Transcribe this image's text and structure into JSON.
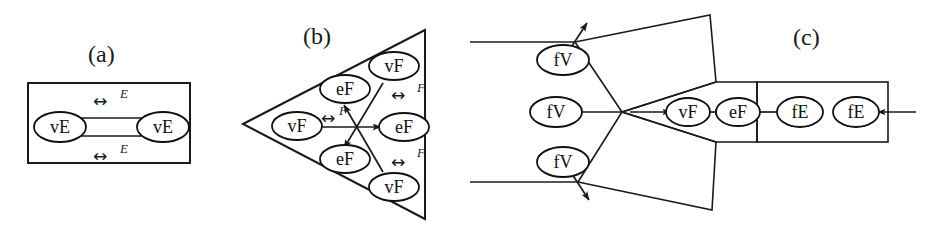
{
  "figure": {
    "background_color": "#ffffff",
    "ink_color": "#1a1a1a",
    "width": 928,
    "height": 242
  },
  "panels": [
    {
      "id": "a",
      "caption": "(a)",
      "container_shape": "rectangle",
      "nodes": [
        {
          "id": "a-n1",
          "label": "vE",
          "cx": 60,
          "cy": 127
        },
        {
          "id": "a-n2",
          "label": "vE",
          "cx": 163,
          "cy": 127
        }
      ],
      "edge_labels": [
        {
          "id": "a-e1",
          "glyph": "↔",
          "label": "E",
          "x": 105,
          "y": 100
        },
        {
          "id": "a-e2",
          "glyph": "↔",
          "label": "E",
          "x": 105,
          "y": 152
        }
      ]
    },
    {
      "id": "b",
      "caption": "(b)",
      "container_shape": "triangle",
      "nodes": [
        {
          "id": "b-n1",
          "label": "vF",
          "cx": 297,
          "cy": 126
        },
        {
          "id": "b-n2",
          "label": "eF",
          "cx": 345,
          "cy": 89
        },
        {
          "id": "b-n3",
          "label": "vF",
          "cx": 394,
          "cy": 66
        },
        {
          "id": "b-n4",
          "label": "eF",
          "cx": 404,
          "cy": 127
        },
        {
          "id": "b-n5",
          "label": "eF",
          "cx": 345,
          "cy": 159
        },
        {
          "id": "b-n6",
          "label": "vF",
          "cx": 394,
          "cy": 187
        }
      ],
      "edge_labels": [
        {
          "id": "b-e1",
          "glyph": "↔",
          "label": "F",
          "x": 328,
          "y": 115
        },
        {
          "id": "b-e2",
          "glyph": "↔",
          "label": "F",
          "x": 404,
          "y": 92
        },
        {
          "id": "b-e3",
          "glyph": "↔",
          "label": "F",
          "x": 404,
          "y": 163
        }
      ]
    },
    {
      "id": "c",
      "caption": "(c)",
      "container_shape": "polygonal-complex",
      "nodes": [
        {
          "id": "c-n1",
          "label": "fV",
          "cx": 563,
          "cy": 60
        },
        {
          "id": "c-n2",
          "label": "fV",
          "cx": 556,
          "cy": 112
        },
        {
          "id": "c-n3",
          "label": "fV",
          "cx": 563,
          "cy": 162
        },
        {
          "id": "c-n4",
          "label": "vF",
          "cx": 688,
          "cy": 112
        },
        {
          "id": "c-n5",
          "label": "eF",
          "cx": 738,
          "cy": 112
        },
        {
          "id": "c-n6",
          "label": "fE",
          "cx": 800,
          "cy": 112
        },
        {
          "id": "c-n7",
          "label": "fE",
          "cx": 856,
          "cy": 112
        }
      ],
      "edge_labels": []
    }
  ],
  "legend": {
    "glyph_bidirectional": "↔",
    "symbol_E": "E",
    "symbol_F": "F"
  }
}
